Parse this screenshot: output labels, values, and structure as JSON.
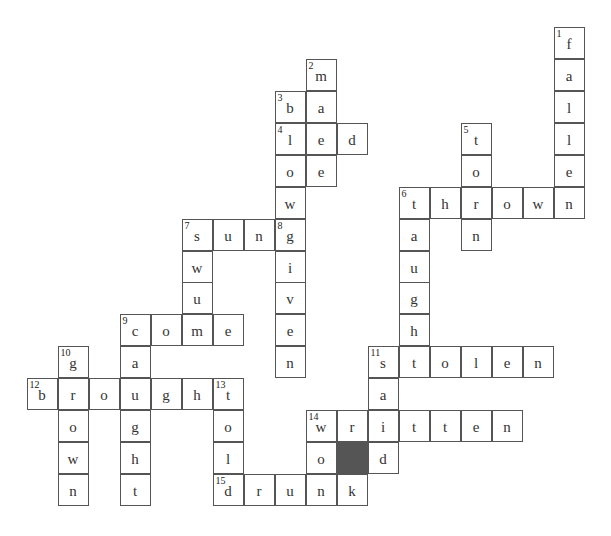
{
  "puzzle": {
    "type": "crossword",
    "rows": 15,
    "cols": 18,
    "colors": {
      "border": "#555555",
      "black_cell": "#555555",
      "text": "#333333",
      "background": "#ffffff"
    },
    "black_cells": [
      [
        13,
        10
      ]
    ],
    "words": [
      {
        "number": 1,
        "direction": "down",
        "row": 0,
        "col": 17,
        "answer": "fallen"
      },
      {
        "number": 2,
        "direction": "down",
        "row": 1,
        "col": 9,
        "answer": "made"
      },
      {
        "number": 3,
        "direction": "down",
        "row": 2,
        "col": 8,
        "answer": "blown"
      },
      {
        "number": 4,
        "direction": "across",
        "row": 3,
        "col": 8,
        "answer": "led"
      },
      {
        "number": 5,
        "direction": "down",
        "row": 3,
        "col": 14,
        "answer": "torn"
      },
      {
        "number": 6,
        "direction": "across",
        "row": 5,
        "col": 12,
        "answer": "thrown"
      },
      {
        "number": 6,
        "direction": "down",
        "row": 5,
        "col": 12,
        "answer": "taught"
      },
      {
        "number": 7,
        "direction": "across",
        "row": 6,
        "col": 5,
        "answer": "sung"
      },
      {
        "number": 7,
        "direction": "down",
        "row": 6,
        "col": 5,
        "answer": "swum"
      },
      {
        "number": 8,
        "direction": "down",
        "row": 6,
        "col": 8,
        "answer": "given"
      },
      {
        "number": 9,
        "direction": "across",
        "row": 9,
        "col": 3,
        "answer": "come"
      },
      {
        "number": 9,
        "direction": "down",
        "row": 9,
        "col": 3,
        "answer": "caught"
      },
      {
        "number": 10,
        "direction": "down",
        "row": 10,
        "col": 1,
        "answer": "grown"
      },
      {
        "number": 11,
        "direction": "across",
        "row": 10,
        "col": 11,
        "answer": "stolen"
      },
      {
        "number": 11,
        "direction": "down",
        "row": 10,
        "col": 11,
        "answer": "said"
      },
      {
        "number": 12,
        "direction": "across",
        "row": 11,
        "col": 0,
        "answer": "brought"
      },
      {
        "number": 13,
        "direction": "down",
        "row": 11,
        "col": 6,
        "answer": "told"
      },
      {
        "number": 14,
        "direction": "across",
        "row": 12,
        "col": 9,
        "answer": "written"
      },
      {
        "number": 14,
        "direction": "down",
        "row": 12,
        "col": 9,
        "answer": "won"
      },
      {
        "number": 15,
        "direction": "across",
        "row": 14,
        "col": 6,
        "answer": "drunk"
      }
    ],
    "extra_cells": [
      {
        "row": 12,
        "col": 10,
        "letter": "r"
      },
      {
        "row": 14,
        "col": 10,
        "letter": "k"
      }
    ]
  }
}
